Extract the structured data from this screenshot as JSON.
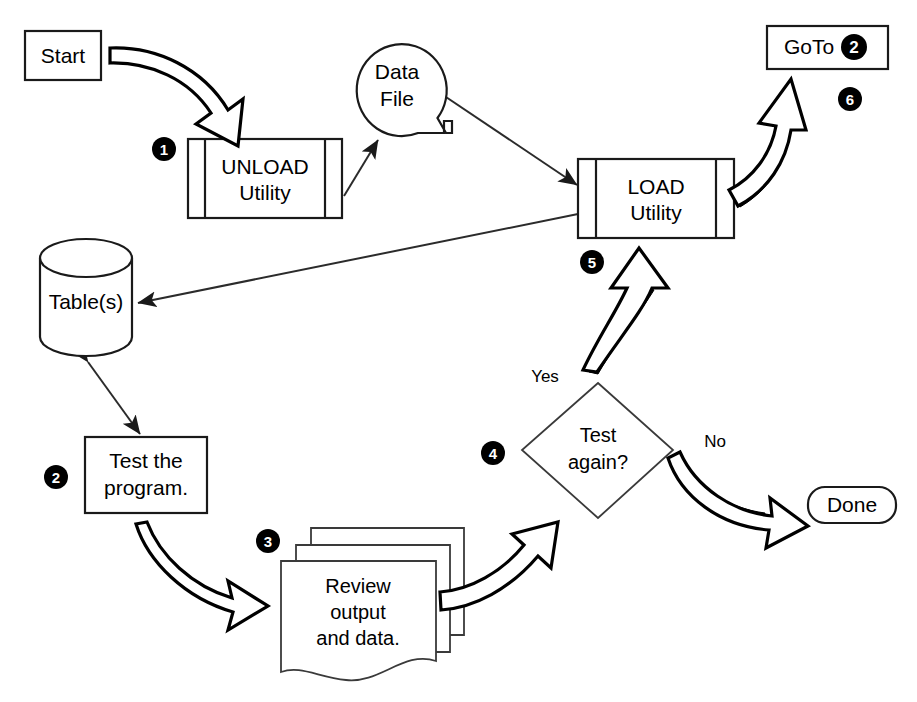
{
  "diagram": {
    "background_color": "#ffffff",
    "line_color": "#1a1a1a",
    "nodes": {
      "start": {
        "label": "Start",
        "shape": "rectangle"
      },
      "unload": {
        "label_line1": "UNLOAD",
        "label_line2": "Utility",
        "shape": "predefined-process"
      },
      "data_file": {
        "label_line1": "Data",
        "label_line2": "File",
        "shape": "stored-data"
      },
      "load": {
        "label_line1": "LOAD",
        "label_line2": "Utility",
        "shape": "predefined-process"
      },
      "goto": {
        "label": "GoTo",
        "badge": "2",
        "shape": "rectangle"
      },
      "tables": {
        "label": "Table(s)",
        "shape": "cylinder-database"
      },
      "test_program": {
        "label_line1": "Test the",
        "label_line2": "program.",
        "shape": "rectangle"
      },
      "review": {
        "label_line1": "Review",
        "label_line2": "output",
        "label_line3": "and data.",
        "shape": "multi-document"
      },
      "test_again": {
        "label_line1": "Test",
        "label_line2": "again?",
        "shape": "diamond"
      },
      "done": {
        "label": "Done",
        "shape": "rounded-rectangle"
      }
    },
    "edge_labels": {
      "yes": "Yes",
      "no": "No"
    },
    "step_markers": [
      {
        "id": "step-1",
        "number": "1",
        "near": "unload"
      },
      {
        "id": "step-2",
        "number": "2",
        "near": "test_program"
      },
      {
        "id": "step-3",
        "number": "3",
        "near": "review"
      },
      {
        "id": "step-4",
        "number": "4",
        "near": "test_again"
      },
      {
        "id": "step-5",
        "number": "5",
        "near": "load"
      },
      {
        "id": "step-6",
        "number": "6",
        "near": "goto"
      }
    ],
    "flow_sequence": [
      "Start -> UNLOAD Utility",
      "UNLOAD Utility -> Data File",
      "Data File -> LOAD Utility",
      "LOAD Utility -> Table(s)",
      "Table(s) <-> Test the program.",
      "Test the program. -> Review output and data.",
      "Review output and data. -> Test again?",
      "Test again? -- Yes --> LOAD Utility",
      "Test again? -- No --> Done",
      "LOAD Utility -> GoTo 2"
    ]
  }
}
